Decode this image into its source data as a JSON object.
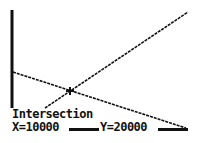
{
  "screen": {
    "type": "graphing-calculator-graph",
    "background": "#ffffff",
    "ink": "#111111"
  },
  "graph": {
    "y_axis": {
      "x": 12,
      "y1": 10,
      "y2": 108
    },
    "lines": [
      {
        "name": "decreasing-line",
        "x1": 13,
        "y1": 72,
        "x2": 186,
        "y2": 128,
        "style": "dashed-pixel"
      },
      {
        "name": "increasing-line",
        "x1": 45,
        "y1": 108,
        "x2": 188,
        "y2": 12,
        "style": "dashed-pixel"
      }
    ],
    "cursor": {
      "x": 70,
      "y": 91,
      "symbol": "+"
    }
  },
  "status": {
    "label": "Intersection",
    "x_text": "X=10000",
    "y_text": "Y=20000"
  }
}
